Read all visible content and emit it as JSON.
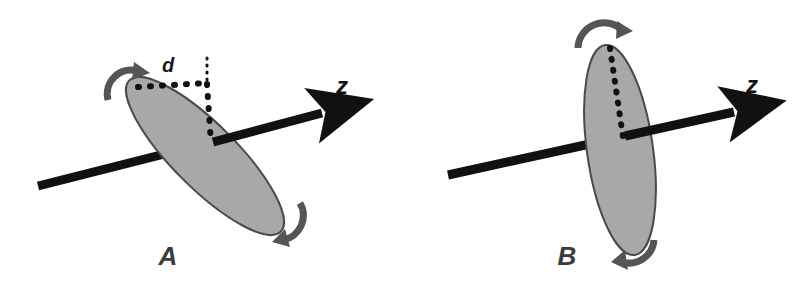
{
  "figure": {
    "type": "scientific-diagram",
    "background_color": "#ffffff",
    "panels": [
      {
        "id": "A",
        "label": "A",
        "label_color": "#3b3b3b",
        "state": "tilted",
        "ellipse": {
          "name": "tilted-disc",
          "fill": "#a8a8a8",
          "stroke": "#4a4a4a",
          "center_x": 205,
          "center_y": 156,
          "semi_major": 107,
          "semi_minor": 32,
          "rotation_deg": 45
        },
        "axis": {
          "name": "z-axis",
          "label": "z",
          "color": "#111111",
          "x1": 38,
          "y1": 186,
          "x2": 330,
          "y2": 111,
          "label_x": 342,
          "label_y": 94
        },
        "dimension": {
          "name": "offset-d",
          "label": "d",
          "label_x": 168,
          "label_y": 72,
          "color": "#1a1a1a"
        },
        "rotation_arrows": [
          {
            "name": "rotation-arrow-top",
            "color": "#555555",
            "direction": "clockwise"
          },
          {
            "name": "rotation-arrow-bottom",
            "color": "#555555",
            "direction": "clockwise"
          }
        ],
        "dotted_guides": [
          {
            "name": "dotted-horizontal-guide",
            "color": "#111111"
          },
          {
            "name": "dotted-vertical-guide",
            "color": "#111111"
          },
          {
            "name": "dotted-tick-guide",
            "color": "#111111"
          }
        ]
      },
      {
        "id": "B",
        "label": "B",
        "label_color": "#3b3b3b",
        "state": "upright",
        "ellipse": {
          "name": "upright-disc",
          "fill": "#a8a8a8",
          "stroke": "#4a4a4a",
          "center_x": 620,
          "center_y": 150,
          "semi_major": 106,
          "semi_minor": 33,
          "rotation_deg": 82
        },
        "axis": {
          "name": "z-axis",
          "label": "z",
          "color": "#111111",
          "x1": 448,
          "y1": 175,
          "x2": 742,
          "y2": 110,
          "label_x": 752,
          "label_y": 93
        },
        "rotation_arrows": [
          {
            "name": "rotation-arrow-top",
            "color": "#555555",
            "direction": "clockwise"
          },
          {
            "name": "rotation-arrow-bottom",
            "color": "#555555",
            "direction": "clockwise"
          }
        ],
        "dotted_guides": [
          {
            "name": "dotted-vertical-guide",
            "color": "#111111"
          }
        ]
      }
    ]
  },
  "labels": {
    "panel_a": "A",
    "panel_b": "B",
    "axis_z_a": "z",
    "axis_z_b": "z",
    "dimension_d": "d"
  }
}
